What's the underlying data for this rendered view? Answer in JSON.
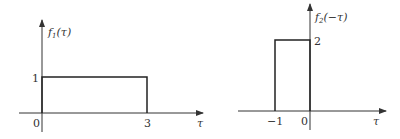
{
  "figure": {
    "left_plot": {
      "ylabel_func": "f",
      "ylabel_sub": "1",
      "ylabel_arg": "(τ)",
      "xlabel": "τ",
      "y_tick": "1",
      "x_ticks": [
        "0",
        "3"
      ],
      "signal": {
        "type": "rect",
        "start": 0,
        "end": 3,
        "height": 1
      }
    },
    "right_plot": {
      "ylabel_func": "f",
      "ylabel_sub": "2",
      "ylabel_arg": "(−τ)",
      "xlabel": "τ",
      "y_tick": "2",
      "x_ticks": [
        "−1",
        "0"
      ],
      "signal": {
        "type": "rect",
        "start": -1,
        "end": 0,
        "height": 2
      }
    },
    "colors": {
      "line": "#222222",
      "axis": "#333333",
      "text": "#333333"
    }
  }
}
